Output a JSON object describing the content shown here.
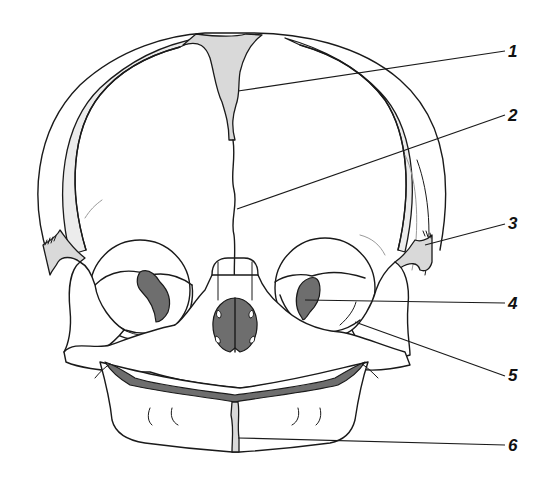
{
  "figure": {
    "colors": {
      "line": "#1a1a1a",
      "fontanelle_fill": "#d9d9d9",
      "cavity_fill": "#6e6e6e",
      "background": "#ffffff"
    }
  },
  "labels": [
    {
      "id": 1,
      "text": "1",
      "x": 507,
      "y": 43,
      "target": [
        268,
        91
      ]
    },
    {
      "id": 2,
      "text": "2",
      "x": 507,
      "y": 107,
      "target": [
        238,
        209
      ]
    },
    {
      "id": 3,
      "text": "3",
      "x": 507,
      "y": 215,
      "target": [
        425,
        245
      ]
    },
    {
      "id": 4,
      "text": "4",
      "x": 507,
      "y": 295,
      "target": [
        310,
        300
      ]
    },
    {
      "id": 5,
      "text": "5",
      "x": 507,
      "y": 368,
      "target": [
        355,
        322
      ]
    },
    {
      "id": 6,
      "text": "6",
      "x": 507,
      "y": 437,
      "target": [
        238,
        438
      ]
    }
  ]
}
